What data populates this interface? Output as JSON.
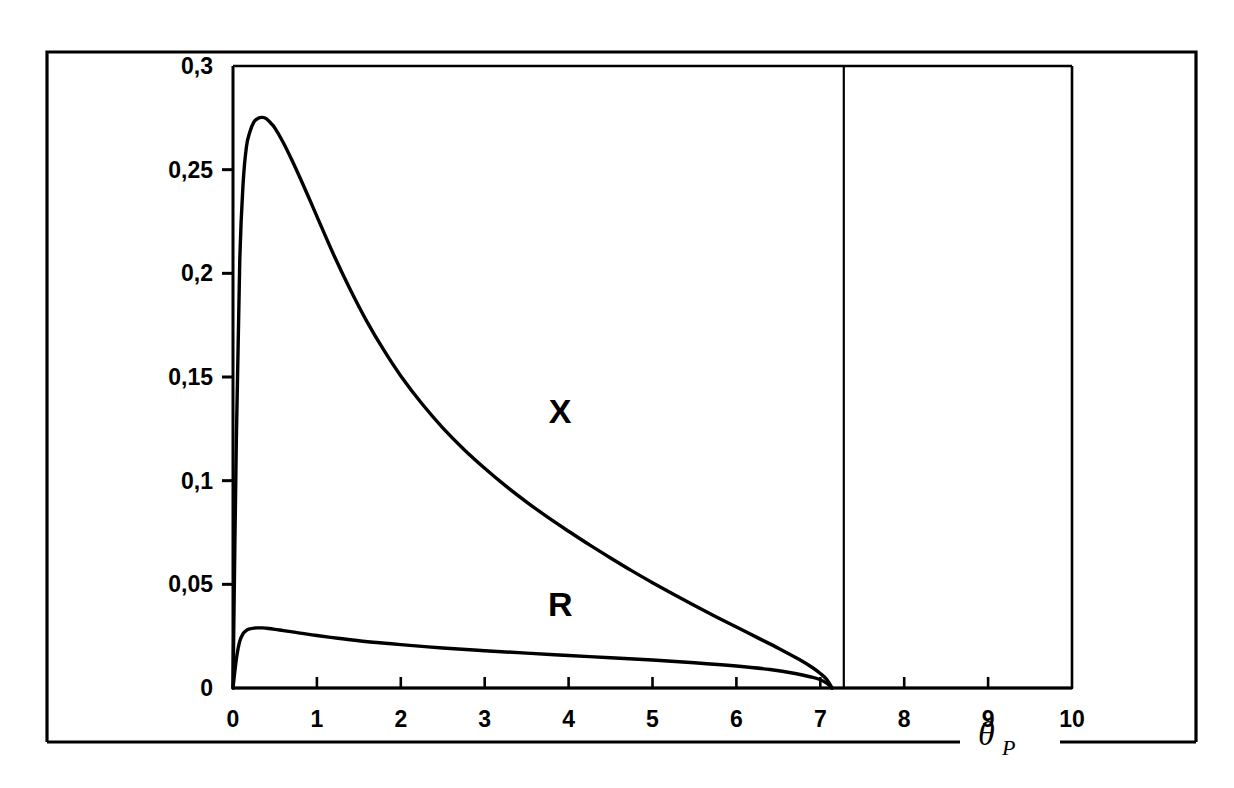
{
  "figure": {
    "background_color": "#ffffff",
    "ink_color": "#000000",
    "frame": {
      "name": "outer-figure-border",
      "x": 47,
      "y": 52,
      "width": 1149,
      "height": 690,
      "bottom_gap_start": 960,
      "bottom_gap_end": 1060
    }
  },
  "chart_data": {
    "type": "line",
    "title": "",
    "subtitle": "",
    "xlabel": "θ",
    "xlabel_subscript": "P",
    "ylabel": "",
    "xlim": [
      0,
      10
    ],
    "ylim": [
      0,
      0.3
    ],
    "grid": false,
    "legend_position": "inline-annotation",
    "x_ticks": [
      0,
      1,
      2,
      3,
      4,
      5,
      6,
      7,
      8,
      9,
      10
    ],
    "x_tick_labels": [
      "0",
      "1",
      "2",
      "3",
      "4",
      "5",
      "6",
      "7",
      "8",
      "9",
      "10"
    ],
    "y_ticks": [
      0,
      0.05,
      0.1,
      0.15,
      0.2,
      0.25,
      0.3
    ],
    "y_tick_labels": [
      "0",
      "0,05",
      "0,1",
      "0,15",
      "0,2",
      "0,25",
      "0,3"
    ],
    "annotations": [
      {
        "name": "curve-label-x",
        "text": "X",
        "x": 3.9,
        "y": 0.128
      },
      {
        "name": "curve-label-r",
        "text": "R",
        "x": 3.9,
        "y": 0.0345
      }
    ],
    "vertical_rule": {
      "name": "cutoff-line",
      "x": 7.28,
      "y_from": 0,
      "y_to": 0.3
    },
    "series": [
      {
        "name": "X",
        "color": "#000000",
        "x": [
          0.0,
          0.04,
          0.08,
          0.12,
          0.16,
          0.2,
          0.25,
          0.3,
          0.35,
          0.4,
          0.45,
          0.5,
          0.6,
          0.7,
          0.8,
          0.9,
          1.0,
          1.2,
          1.4,
          1.6,
          1.8,
          2.0,
          2.25,
          2.5,
          2.75,
          3.0,
          3.25,
          3.5,
          3.75,
          4.0,
          4.25,
          4.5,
          4.75,
          5.0,
          5.25,
          5.5,
          5.75,
          6.0,
          6.25,
          6.5,
          6.75,
          6.9,
          7.0,
          7.08,
          7.14
        ],
        "y": [
          0.0,
          0.12,
          0.205,
          0.243,
          0.261,
          0.268,
          0.273,
          0.2748,
          0.2752,
          0.2745,
          0.2725,
          0.27,
          0.263,
          0.2548,
          0.246,
          0.2368,
          0.2275,
          0.209,
          0.192,
          0.1765,
          0.1628,
          0.1505,
          0.1372,
          0.1255,
          0.1152,
          0.106,
          0.0975,
          0.0897,
          0.0824,
          0.0756,
          0.069,
          0.0627,
          0.0566,
          0.0508,
          0.0452,
          0.0398,
          0.0345,
          0.0294,
          0.0243,
          0.0192,
          0.0137,
          0.01,
          0.007,
          0.004,
          0.0
        ]
      },
      {
        "name": "R",
        "color": "#000000",
        "x": [
          0.0,
          0.04,
          0.08,
          0.12,
          0.16,
          0.2,
          0.25,
          0.3,
          0.35,
          0.4,
          0.5,
          0.6,
          0.8,
          1.0,
          1.25,
          1.5,
          1.75,
          2.0,
          2.5,
          3.0,
          3.5,
          4.0,
          4.5,
          5.0,
          5.5,
          6.0,
          6.4,
          6.7,
          6.9,
          7.0,
          7.08,
          7.14
        ],
        "y": [
          0.0,
          0.014,
          0.0225,
          0.0262,
          0.0278,
          0.0285,
          0.0289,
          0.029,
          0.029,
          0.0288,
          0.0283,
          0.0277,
          0.0265,
          0.0253,
          0.024,
          0.0228,
          0.0218,
          0.0209,
          0.0193,
          0.018,
          0.0168,
          0.0157,
          0.0146,
          0.0135,
          0.0122,
          0.0106,
          0.0089,
          0.007,
          0.0052,
          0.004,
          0.0022,
          0.0
        ]
      },
      {
        "name": "baseline",
        "color": "#000000",
        "x": [
          0.0,
          10.0
        ],
        "y": [
          0.0,
          0.0
        ]
      }
    ]
  }
}
